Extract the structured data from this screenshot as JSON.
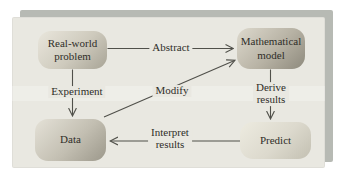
{
  "diagram": {
    "nodes": {
      "real_world_problem": "Real-world\nproblem",
      "mathematical_model": "Mathematical\nmodel",
      "data": "Data",
      "predict": "Predict"
    },
    "edge_labels": {
      "abstract": "Abstract",
      "experiment": "Experiment",
      "modify": "Modify",
      "derive_results": "Derive\nresults",
      "interpret_results": "Interpret\nresults"
    },
    "edges": [
      {
        "from": "real_world_problem",
        "to": "mathematical_model",
        "label": "Abstract"
      },
      {
        "from": "real_world_problem",
        "to": "data",
        "label": "Experiment"
      },
      {
        "from": "mathematical_model",
        "to": "predict",
        "label": "Derive results"
      },
      {
        "from": "predict",
        "to": "data",
        "label": "Interpret results"
      },
      {
        "from": "data",
        "to": "mathematical_model",
        "label": "Modify"
      }
    ],
    "colors": {
      "page_bg": "#ffffff",
      "panel_bg": "#e9e8e1",
      "shadow_card": "#b7bab4",
      "node_gradient_light": "#e9e6dc",
      "node_gradient_dark": "#8e8a7d",
      "line": "#50504a",
      "text": "#2f2e29"
    }
  }
}
